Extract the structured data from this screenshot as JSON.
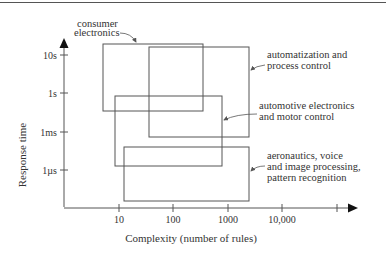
{
  "diagram": {
    "x_axis": {
      "label": "Complexity (number of rules)",
      "ticks": [
        "10",
        "100",
        "1000",
        "10,000",
        ""
      ]
    },
    "y_axis": {
      "label": "Response time",
      "ticks": [
        "10s",
        "1s",
        "1ms",
        "1µs"
      ]
    },
    "regions": [
      {
        "id": "consumer",
        "label_lines": [
          "consumer",
          "electronics"
        ]
      },
      {
        "id": "automatization",
        "label_lines": [
          "automatization and",
          "process control"
        ]
      },
      {
        "id": "automotive",
        "label_lines": [
          "automotive electronics",
          "and motor control"
        ]
      },
      {
        "id": "aeronautics",
        "label_lines": [
          "aeronautics, voice",
          "and image processing,",
          "pattern recognition"
        ]
      }
    ],
    "colors": {
      "line": "#555555",
      "text": "#333333"
    }
  }
}
